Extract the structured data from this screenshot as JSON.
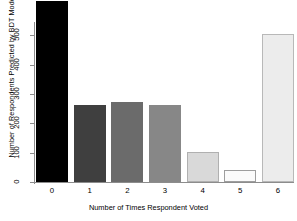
{
  "chart_data": {
    "type": "bar",
    "title": "",
    "xlabel": "Number of Times Respondent Voted",
    "ylabel": "Number of Respondents Predicted by BDT Model",
    "categories": [
      "0",
      "1",
      "2",
      "3",
      "4",
      "5",
      "6"
    ],
    "values": [
      620,
      263,
      273,
      263,
      102,
      41,
      505
    ],
    "bar_colors": [
      "#000000",
      "#3f3f3f",
      "#6b6b6b",
      "#878787",
      "#d9d9d9",
      "#fbfbfb",
      "#ececec"
    ],
    "bar_border_colors": [
      "#000000",
      "#3f3f3f",
      "#6b6b6b",
      "#878787",
      "#b0b0b0",
      "#9e9e9e",
      "#b8b8b8"
    ],
    "ylim": [
      0,
      620
    ],
    "yticks": [
      0,
      100,
      200,
      300,
      400,
      500
    ],
    "ytick_labels": [
      "0",
      "100",
      "200",
      "300",
      "400",
      "500"
    ],
    "grid": false,
    "legend": "none",
    "axis_color": "#8c8c8c",
    "note": "Top bar is clipped at the plot boundary above the 500 tick"
  }
}
